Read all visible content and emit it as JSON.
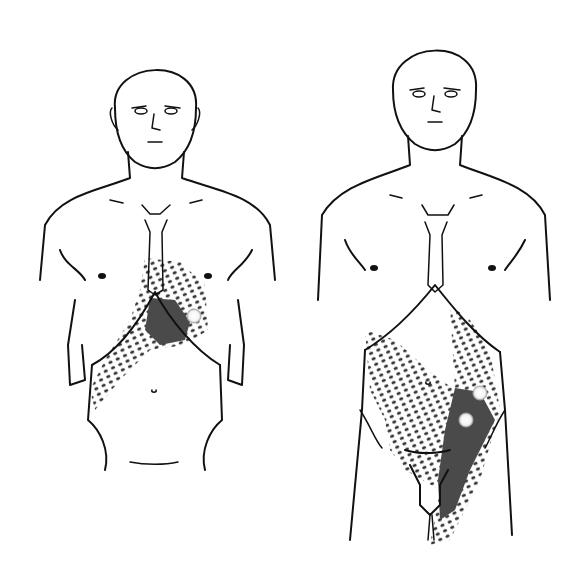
{
  "figure": {
    "type": "anatomical-referred-pain-diagram",
    "panels": [
      {
        "id": "left",
        "view": "anterior torso, upper abdomen pain pattern",
        "shading": "stippled referral zone with dense essential zone over epigastrium",
        "trigger_points": 1
      },
      {
        "id": "right",
        "view": "anterior torso, lower abdomen/groin pain pattern",
        "shading": "stippled referral zone with dense essential zone over left lower quadrant",
        "trigger_points": 2
      }
    ],
    "colors": {
      "line": "#111111",
      "stipple": "#333333",
      "essential_zone": "#4a4a4a",
      "trigger_point": "#ffffff",
      "background": "#ffffff"
    }
  }
}
